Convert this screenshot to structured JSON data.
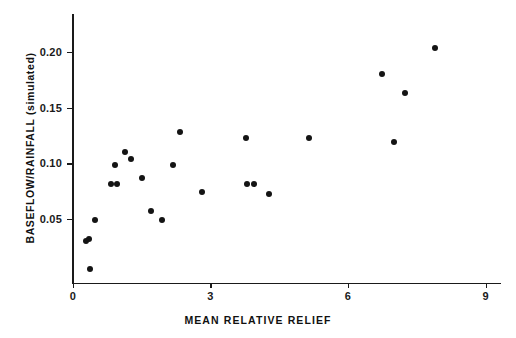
{
  "chart_data": {
    "type": "scatter",
    "title": "",
    "xlabel": "MEAN RELATIVE RELIEF",
    "ylabel": "BASEFLOW/RAINFALL (simulated)",
    "xlim": [
      0,
      9
    ],
    "ylim": [
      0,
      0.225
    ],
    "xticks": [
      0,
      3,
      6,
      9
    ],
    "xtick_labels": [
      "0",
      "3",
      "6",
      "9"
    ],
    "yticks": [
      0.05,
      0.1,
      0.15,
      0.2
    ],
    "ytick_labels": [
      "0.05",
      "0.10",
      "0.15",
      "0.20"
    ],
    "grid": false,
    "legend": false,
    "marker": "filled-circle",
    "marker_color": "#141414",
    "axis_color": "#1a1a1a",
    "background_color": "#ffffff",
    "points": [
      {
        "x": 0.28,
        "y": 0.03
      },
      {
        "x": 0.35,
        "y": 0.032
      },
      {
        "x": 0.37,
        "y": 0.005
      },
      {
        "x": 0.48,
        "y": 0.049
      },
      {
        "x": 0.83,
        "y": 0.082
      },
      {
        "x": 0.92,
        "y": 0.099
      },
      {
        "x": 0.96,
        "y": 0.082
      },
      {
        "x": 1.14,
        "y": 0.11
      },
      {
        "x": 1.27,
        "y": 0.104
      },
      {
        "x": 1.51,
        "y": 0.087
      },
      {
        "x": 1.7,
        "y": 0.057
      },
      {
        "x": 1.95,
        "y": 0.049
      },
      {
        "x": 2.19,
        "y": 0.099
      },
      {
        "x": 2.34,
        "y": 0.128
      },
      {
        "x": 2.82,
        "y": 0.074
      },
      {
        "x": 3.77,
        "y": 0.123
      },
      {
        "x": 3.8,
        "y": 0.082
      },
      {
        "x": 3.94,
        "y": 0.082
      },
      {
        "x": 4.28,
        "y": 0.073
      },
      {
        "x": 5.15,
        "y": 0.123
      },
      {
        "x": 6.74,
        "y": 0.18
      },
      {
        "x": 7.0,
        "y": 0.119
      },
      {
        "x": 7.24,
        "y": 0.163
      },
      {
        "x": 7.9,
        "y": 0.204
      }
    ]
  }
}
